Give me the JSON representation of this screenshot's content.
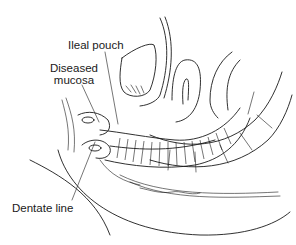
{
  "figure": {
    "labels": {
      "ileal_pouch": "Ileal pouch",
      "diseased_mucosa_line1": "Diseased",
      "diseased_mucosa_line2": "mucosa",
      "dentate_line": "Dentate line"
    },
    "colors": {
      "ink": "#1a1a1a",
      "background": "#ffffff"
    }
  }
}
